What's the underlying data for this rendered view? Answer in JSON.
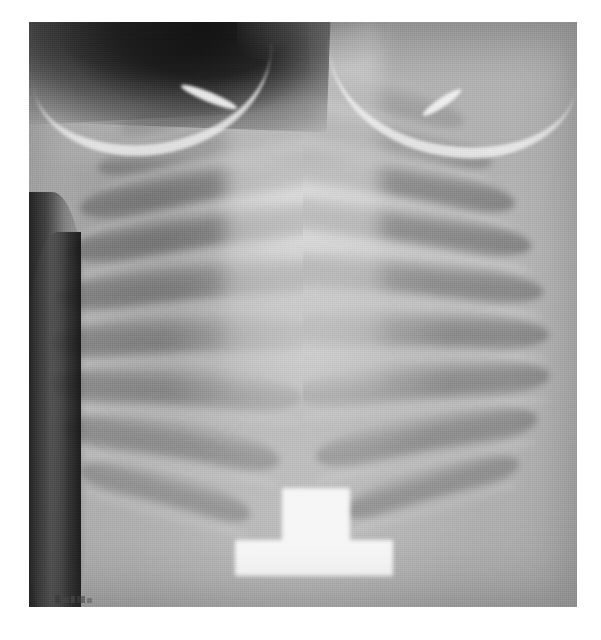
{
  "page": {
    "background_color": "#ffffff",
    "width": 601,
    "height": 640
  },
  "image": {
    "kind": "chest-radiograph",
    "modality": "X-ray",
    "view": "AP (anteroposterior) frontal chest",
    "subject": "pediatric thorax",
    "color_mode": "grayscale",
    "frame": {
      "x": 29,
      "y": 22,
      "width": 548,
      "height": 585
    },
    "background_tone": "#9a9a9a",
    "caption": "",
    "visible_text": ""
  },
  "anatomy": {
    "regions": [
      {
        "name": "left-apex-air",
        "label": "supraclavicular air (dark)",
        "tone": "#141414"
      },
      {
        "name": "right-apex-air",
        "label": "supraclavicular air (dark)",
        "tone": "#121212"
      },
      {
        "name": "clavicle-left",
        "label": "clavicle",
        "tone": "#eeeeee"
      },
      {
        "name": "clavicle-right",
        "label": "clavicle",
        "tone": "#f0f0f0"
      },
      {
        "name": "mediastinum",
        "label": "mediastinum / heart silhouette",
        "tone": "#dcdcdc"
      },
      {
        "name": "lung-field-left",
        "label": "left lung field",
        "tone": "#a0a0a0"
      },
      {
        "name": "lung-field-right",
        "label": "right lung field",
        "tone": "#9e9e9e"
      },
      {
        "name": "diaphragm",
        "label": "diaphragm / abdomen",
        "tone": "#b0b0b0"
      },
      {
        "name": "flank-left",
        "label": "air outside body wall",
        "tone": "#1a1a1a"
      },
      {
        "name": "flank-right",
        "label": "air outside body wall",
        "tone": "#161616"
      }
    ],
    "ribs_left": [
      {
        "top_pct": 10,
        "left_pct": 16,
        "width_pct": 42,
        "height_pct": 7,
        "rotate": -14,
        "opacity": 0.42
      },
      {
        "top_pct": 17,
        "left_pct": 12,
        "width_pct": 46,
        "height_pct": 7,
        "rotate": -12,
        "opacity": 0.46
      },
      {
        "top_pct": 24,
        "left_pct": 9,
        "width_pct": 49,
        "height_pct": 8,
        "rotate": -10,
        "opacity": 0.5
      },
      {
        "top_pct": 32,
        "left_pct": 7,
        "width_pct": 51,
        "height_pct": 8,
        "rotate": -8,
        "opacity": 0.5
      },
      {
        "top_pct": 41,
        "left_pct": 5,
        "width_pct": 52,
        "height_pct": 8,
        "rotate": -5,
        "opacity": 0.46
      },
      {
        "top_pct": 50,
        "left_pct": 4,
        "width_pct": 50,
        "height_pct": 8,
        "rotate": -2,
        "opacity": 0.44
      },
      {
        "top_pct": 59,
        "left_pct": 4,
        "width_pct": 46,
        "height_pct": 8,
        "rotate": 3,
        "opacity": 0.42
      },
      {
        "top_pct": 68,
        "left_pct": 6,
        "width_pct": 40,
        "height_pct": 8,
        "rotate": 9,
        "opacity": 0.4
      },
      {
        "top_pct": 77,
        "left_pct": 9,
        "width_pct": 32,
        "height_pct": 7,
        "rotate": 15,
        "opacity": 0.36
      }
    ],
    "ribs_right": [
      {
        "top_pct": 9,
        "right_pct": 20,
        "width_pct": 40,
        "height_pct": 7,
        "rotate": 14,
        "opacity": 0.44
      },
      {
        "top_pct": 16,
        "right_pct": 15,
        "width_pct": 45,
        "height_pct": 7,
        "rotate": 12,
        "opacity": 0.48
      },
      {
        "top_pct": 23,
        "right_pct": 11,
        "width_pct": 49,
        "height_pct": 8,
        "rotate": 10,
        "opacity": 0.52
      },
      {
        "top_pct": 31,
        "right_pct": 8,
        "width_pct": 52,
        "height_pct": 8,
        "rotate": 8,
        "opacity": 0.52
      },
      {
        "top_pct": 40,
        "right_pct": 6,
        "width_pct": 53,
        "height_pct": 8,
        "rotate": 5,
        "opacity": 0.48
      },
      {
        "top_pct": 49,
        "right_pct": 5,
        "width_pct": 51,
        "height_pct": 8,
        "rotate": 1,
        "opacity": 0.46
      },
      {
        "top_pct": 58,
        "right_pct": 5,
        "width_pct": 47,
        "height_pct": 8,
        "rotate": -4,
        "opacity": 0.44
      },
      {
        "top_pct": 67,
        "right_pct": 7,
        "width_pct": 41,
        "height_pct": 8,
        "rotate": -10,
        "opacity": 0.42
      },
      {
        "top_pct": 76,
        "right_pct": 10,
        "width_pct": 33,
        "height_pct": 7,
        "rotate": -16,
        "opacity": 0.38
      }
    ]
  },
  "marker": {
    "name": "radiopaque-marker",
    "shape": "T-shaped",
    "tone": "#f4f4f4",
    "position": {
      "x": 235,
      "y": 488,
      "width": 158,
      "height": 88
    },
    "label": ""
  },
  "annotations": {
    "corner_marks_label": "",
    "corner_marks_count": 5
  }
}
